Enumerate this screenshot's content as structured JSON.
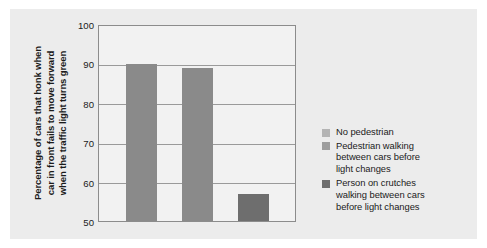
{
  "chart_data": {
    "type": "bar",
    "title": "",
    "subtitle": "",
    "xlabel": "",
    "ylabel": "Percentage of cars that honk when\ncar in front fails to move forward\nwhen the traffic light turns green",
    "ylim": [
      50,
      100
    ],
    "yticks": [
      100,
      90,
      80,
      70,
      60,
      50
    ],
    "ytick_labels": [
      "100",
      "90",
      "80",
      "70",
      "60",
      "50"
    ],
    "grid": true,
    "grid_axis": "y",
    "legend_position": "right",
    "categories": [
      "No pedestrian",
      "Pedestrian walking between cars before light changes",
      "Person on crutches walking between cars before light changes"
    ],
    "values": [
      90,
      89,
      57
    ],
    "bar_colors": [
      "#8a8a8a",
      "#8a8a8a",
      "#6e6e6e"
    ],
    "series": [
      {
        "name": "Percentage of cars that honk",
        "values": [
          90,
          89,
          57
        ]
      }
    ],
    "annotations": []
  },
  "axis": {
    "y_title_lines": [
      "Percentage of cars that honk when",
      "car in front fails to move forward",
      "when the traffic light turns green"
    ],
    "y_title": "Percentage of cars that honk when\ncar in front fails to move forward\nwhen the traffic light turns green",
    "ticks": [
      {
        "label": "100",
        "value": 100
      },
      {
        "label": "90",
        "value": 90
      },
      {
        "label": "80",
        "value": 80
      },
      {
        "label": "70",
        "value": 70
      },
      {
        "label": "60",
        "value": 60
      },
      {
        "label": "50",
        "value": 50
      }
    ]
  },
  "bars": [
    {
      "label": "No pedestrian",
      "value": 90,
      "color": "#8a8a8a"
    },
    {
      "label": "Pedestrian walking between cars before light changes",
      "value": 89,
      "color": "#8a8a8a"
    },
    {
      "label": "Person on crutches walking between cars before light changes",
      "value": 57,
      "color": "#6e6e6e"
    }
  ],
  "legend": {
    "items": [
      {
        "label": "No pedestrian",
        "swatch": "#b4b4b4"
      },
      {
        "label": "Pedestrian walking\nbetween cars before\nlight changes",
        "swatch": "#9d9d9d"
      },
      {
        "label": "Person on crutches\nwalking between cars\nbefore light changes",
        "swatch": "#6e6e6e"
      }
    ]
  },
  "colors": {
    "page_background": "#ffffff",
    "panel_background": "#ececec",
    "plot_background": "#f2f2f2",
    "plot_border": "#8c8c8c",
    "gridline": "#9a9a9a",
    "bar_light": "#8a8a8a",
    "bar_dark": "#6e6e6e",
    "text": "#1b1b1b"
  }
}
